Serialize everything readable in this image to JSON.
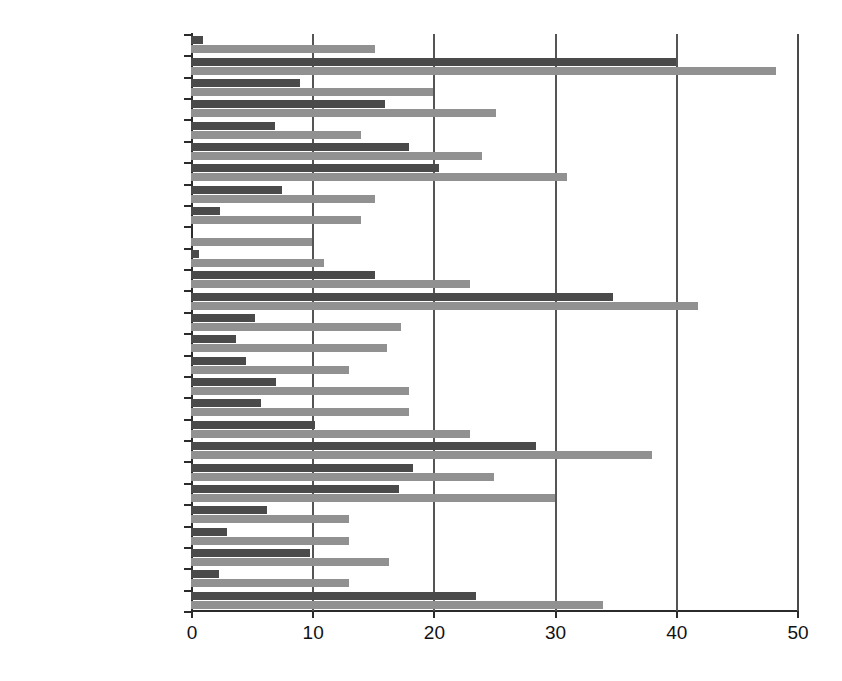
{
  "chart_data": {
    "type": "bar",
    "orientation": "horizontal",
    "title": "",
    "subtitle": "",
    "xlabel": "",
    "ylabel": "",
    "xlim": [
      0,
      50
    ],
    "ylim": null,
    "xticks": [
      0,
      10,
      20,
      30,
      40,
      50
    ],
    "xticklabels": [
      "0",
      "10",
      "20",
      "30",
      "40",
      "50"
    ],
    "grid": "vertical",
    "legend": "none",
    "legend_entries": [],
    "colors": {
      "series_a": "#4a4a4a",
      "series_b": "#919191",
      "axis": "#2b2b2b",
      "gridline": "#555555",
      "background": "#ffffff",
      "text": "#111111"
    },
    "categories": [
      "United Kingdom",
      "Sweden",
      "Spain",
      "Slovenia",
      "Slovakia",
      "Romania",
      "Portygal",
      "Poland",
      "Netherlands",
      "Malta",
      "Luxembourg",
      "Lithuania",
      "latvia",
      "Italy",
      "Ireland",
      "Hungary",
      "Greece",
      "Germany",
      "France",
      "Finland",
      "Estonia",
      "Denmark",
      "Czech Republic",
      "Cyprus",
      "Bulgaria",
      "Belgium",
      "Austria"
    ],
    "series": [
      {
        "name": "series_a",
        "color": "#4a4a4a",
        "values": [
          1.0,
          40.0,
          9.0,
          16.0,
          6.9,
          18.0,
          20.5,
          7.5,
          2.4,
          0.0,
          0.7,
          15.2,
          34.8,
          5.3,
          3.7,
          4.5,
          7.0,
          5.8,
          10.2,
          28.5,
          18.3,
          17.2,
          6.3,
          3.0,
          9.8,
          2.3,
          23.5
        ]
      },
      {
        "name": "series_b",
        "color": "#919191",
        "values": [
          15.2,
          48.3,
          20.0,
          25.2,
          14.0,
          24.0,
          31.0,
          15.2,
          14.0,
          10.0,
          11.0,
          23.0,
          41.8,
          17.3,
          16.2,
          13.0,
          18.0,
          18.0,
          23.0,
          38.0,
          25.0,
          30.0,
          13.0,
          13.0,
          16.3,
          13.0,
          34.0
        ]
      }
    ]
  }
}
